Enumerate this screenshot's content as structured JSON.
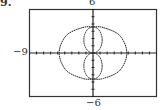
{
  "problem": {
    "label": "9."
  },
  "chart_data": {
    "type": "line",
    "title": "",
    "window": {
      "xmin": -9,
      "xmax": 9,
      "ymin": -6,
      "ymax": 6
    },
    "tick_labels": {
      "xmin": "−9",
      "ymax": "6",
      "ymin": "−6"
    },
    "grid": false,
    "axes_ticks": {
      "x_step": 1,
      "y_step": 1
    },
    "series": [
      {
        "name": "outer curve",
        "points_approx": [
          [
            4.8,
            0
          ],
          [
            3.8,
            2.4
          ],
          [
            1.5,
            3.5
          ],
          [
            0,
            3.6
          ],
          [
            -1.5,
            3.5
          ],
          [
            -3.8,
            2.4
          ],
          [
            -4.8,
            0
          ],
          [
            -3.8,
            -2.4
          ],
          [
            -1.5,
            -3.5
          ],
          [
            0,
            -3.6
          ],
          [
            1.5,
            -3.5
          ],
          [
            3.8,
            -2.4
          ],
          [
            4.8,
            0
          ]
        ]
      },
      {
        "name": "upper inner loop",
        "center": [
          0,
          1.8
        ],
        "rx": 1.3,
        "ry": 1.8
      },
      {
        "name": "lower inner loop",
        "center": [
          0,
          -1.8
        ],
        "rx": 1.3,
        "ry": 1.8
      }
    ],
    "xlabel": "",
    "ylabel": ""
  }
}
